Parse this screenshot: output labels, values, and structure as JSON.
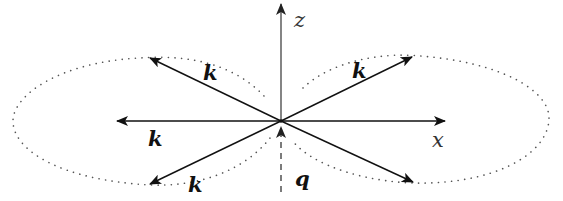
{
  "diagram": {
    "type": "vector-lobes",
    "axes": {
      "z": {
        "label": "z"
      },
      "x": {
        "label": "x"
      }
    },
    "vectors": [
      {
        "id": "k-upper-left",
        "label": "k"
      },
      {
        "id": "k-left",
        "label": "k"
      },
      {
        "id": "k-lower-left",
        "label": "k"
      },
      {
        "id": "k-upper-right",
        "label": "k"
      },
      {
        "id": "k-lower-right",
        "label": ""
      }
    ],
    "incoming": {
      "id": "q",
      "label": "q",
      "style": "dashed"
    },
    "lobes": [
      {
        "id": "left-lobe",
        "style": "dotted"
      },
      {
        "id": "right-lobe",
        "style": "dotted"
      }
    ],
    "colors": {
      "line": "#111111",
      "axis": "#555555",
      "dots": "#555555",
      "background": "#ffffff"
    }
  }
}
